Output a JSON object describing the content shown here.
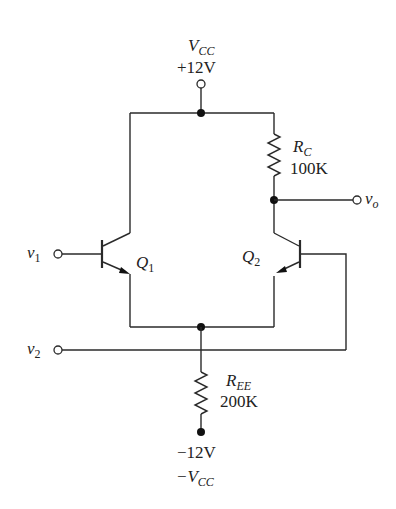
{
  "diagram": {
    "type": "circuit-schematic",
    "supply_positive": {
      "symbol": "V",
      "subscript": "CC",
      "value": "+12V"
    },
    "supply_negative": {
      "value": "−12V",
      "symbol": "−V",
      "subscript": "CC"
    },
    "components": {
      "rc": {
        "symbol": "R",
        "subscript": "C",
        "value": "100K"
      },
      "ree": {
        "symbol": "R",
        "subscript": "EE",
        "value": "200K"
      },
      "q1": {
        "symbol": "Q",
        "subscript": "1"
      },
      "q2": {
        "symbol": "Q",
        "subscript": "2"
      }
    },
    "terminals": {
      "v1": {
        "symbol": "v",
        "subscript": "1"
      },
      "v2": {
        "symbol": "v",
        "subscript": "2"
      },
      "vo": {
        "symbol": "v",
        "subscript": "o"
      }
    },
    "colors": {
      "wire": "#2a2a2a",
      "node": "#111111",
      "background": "#ffffff"
    }
  }
}
